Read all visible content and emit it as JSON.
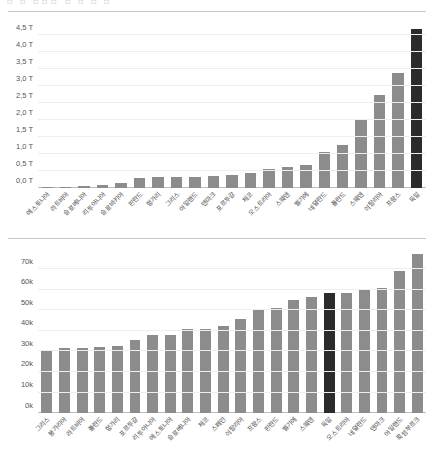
{
  "page": {
    "cut_off_header": "ㅁ ㅁ   ㅁㅁㅁ ㅁ    ㅁ   ㅁ   ㅁ"
  },
  "chart_data": [
    {
      "id": "gdp-chart",
      "type": "bar",
      "title": "",
      "xlabel": "",
      "ylabel": "",
      "ylim": [
        0,
        5.0
      ],
      "grid": true,
      "legend": "none",
      "highlight_color": "#2b2b2b",
      "bar_color": "#8c8c8c",
      "highlighted_category": "독일",
      "ytick_labels": [
        "0,0 T",
        "0,5 T",
        "1,0 T",
        "1,5 T",
        "2,0 T",
        "2,5 T",
        "3,0 T",
        "3,5 T",
        "4,0 T",
        "4,5 T"
      ],
      "ytick_values": [
        0,
        0.5,
        1.0,
        1.5,
        2.0,
        2.5,
        3.0,
        3.5,
        4.0,
        4.5
      ],
      "categories": [
        "에스토니아",
        "라트비아",
        "슬로베니아",
        "리투아니아",
        "슬로바키아",
        "핀란드",
        "헝가리",
        "그리스",
        "아일랜드",
        "덴마크",
        "포르투갈",
        "체코",
        "오스트리아",
        "스웨덴",
        "벨기에",
        "네덜란드",
        "폴란드",
        "스웨덴",
        "이탈리아",
        "프랑스",
        "독일"
      ],
      "values": [
        0.03,
        0.04,
        0.07,
        0.09,
        0.15,
        0.29,
        0.32,
        0.32,
        0.33,
        0.36,
        0.38,
        0.43,
        0.55,
        0.62,
        0.67,
        1.06,
        1.27,
        2.03,
        2.73,
        3.39,
        4.68
      ]
    },
    {
      "id": "gdp-per-capita-chart",
      "type": "bar",
      "title": "",
      "xlabel": "",
      "ylabel": "",
      "ylim": [
        0,
        78000
      ],
      "grid": true,
      "legend": "none",
      "highlight_color": "#2b2b2b",
      "bar_color": "#8c8c8c",
      "highlighted_category": "독일",
      "ytick_labels": [
        "0k",
        "10k",
        "20k",
        "30k",
        "40k",
        "50k",
        "60k",
        "70k"
      ],
      "ytick_values": [
        0,
        10000,
        20000,
        30000,
        40000,
        50000,
        60000,
        70000
      ],
      "categories": [
        "그리스",
        "불가리아",
        "라트비아",
        "폴란드",
        "헝가리",
        "포르투갈",
        "리투아니아",
        "에스토니아",
        "슬로베니아",
        "체코",
        "스페인",
        "이탈리아",
        "프랑스",
        "핀란드",
        "벨기에",
        "스웨덴",
        "독일",
        "오스트리아",
        "네덜란드",
        "덴마크",
        "아일랜드",
        "룩셈부르크"
      ],
      "values": [
        30500,
        31800,
        31900,
        32300,
        32800,
        35500,
        38100,
        38000,
        40900,
        40800,
        42300,
        45700,
        50600,
        51400,
        55000,
        56700,
        58700,
        58600,
        59900,
        61000,
        69000,
        77500
      ]
    }
  ]
}
